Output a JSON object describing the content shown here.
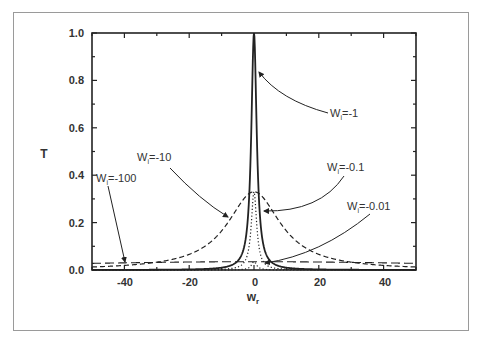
{
  "chart_data": {
    "type": "line",
    "title": "",
    "xlabel": "W_r",
    "ylabel": "T",
    "xlim": [
      -50,
      50
    ],
    "ylim": [
      0,
      1.0
    ],
    "x_ticks": [
      "-40",
      "-20",
      "0",
      "20",
      "40"
    ],
    "y_ticks": [
      "0.0",
      "0.2",
      "0.4",
      "0.6",
      "0.8",
      "1.0"
    ],
    "grid": false,
    "legend": "inline annotations with arrows",
    "series": [
      {
        "name": "Wi=-1",
        "style": "solid",
        "peak": 1.0,
        "half_width": 1.0
      },
      {
        "name": "Wi=-10",
        "style": "dashed",
        "peak": 0.33,
        "half_width": 10
      },
      {
        "name": "Wi=-0.1",
        "style": "dotted",
        "peak": 0.33,
        "half_width": 1.0
      },
      {
        "name": "Wi=-100",
        "style": "long-dashed",
        "peak": 0.035,
        "half_width": 100
      },
      {
        "name": "Wi=-0.01",
        "style": "dotted",
        "peak": 0.035,
        "half_width": 1.0
      }
    ],
    "annotations": [
      {
        "text": "Wi=-1",
        "points_to": "Wi=-1 curve near T=0.85"
      },
      {
        "text": "Wi=-10",
        "points_to": "Wi=-10 curve near (-7, 0.23)"
      },
      {
        "text": "Wi=-0.1",
        "points_to": "Wi=-0.1 curve near (0, 0.25)"
      },
      {
        "text": "Wi=-0.01",
        "points_to": "Wi=-0.01 curve near (0, 0.02)"
      },
      {
        "text": "Wi=-100",
        "points_to": "Wi=-100 curve near (-40, 0.03)"
      }
    ]
  },
  "labels": {
    "y_axis": "T",
    "x_axis_main": "w",
    "x_axis_sub": "r",
    "ann_wi1": "W",
    "ann_wi1_val": "=-1",
    "ann_wi10": "W",
    "ann_wi10_val": "=-10",
    "ann_wi01": "W",
    "ann_wi01_val": "=-0.1",
    "ann_wi001": "W",
    "ann_wi001_val": "=-0.01",
    "ann_wi100": "W",
    "ann_wi100_val": "=-100",
    "sub_i": "i"
  },
  "ticks": {
    "x": [
      "-40",
      "-20",
      "0",
      "20",
      "40"
    ],
    "y": [
      "0.0",
      "0.2",
      "0.4",
      "0.6",
      "0.8",
      "1.0"
    ]
  }
}
